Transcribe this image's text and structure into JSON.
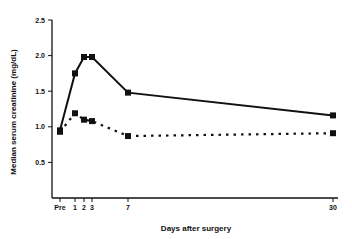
{
  "chart_data": {
    "type": "line",
    "title": "",
    "xlabel": "Days after surgery",
    "ylabel": "Median serum creatinine (mg/dL)",
    "x": [
      "Pre",
      "1",
      "2",
      "3",
      "7",
      "30"
    ],
    "x_positions": [
      60,
      75,
      84,
      92,
      128,
      333
    ],
    "ylim": [
      0,
      2.5
    ],
    "yticks": [
      "0.5",
      "1.0",
      "1.5",
      "2.0",
      "2.5"
    ],
    "grid": false,
    "legend": null,
    "series": [
      {
        "name": "solid",
        "style": "solid",
        "values": [
          0.95,
          1.75,
          1.98,
          1.98,
          1.48,
          1.16
        ]
      },
      {
        "name": "dashed",
        "style": "dashed",
        "values": [
          0.93,
          1.19,
          1.1,
          1.08,
          0.87,
          0.91
        ]
      }
    ]
  }
}
